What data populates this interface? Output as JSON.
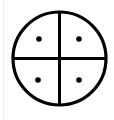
{
  "symbol": {
    "name": "quartered-circle-with-dots",
    "stroke_color": "#000000",
    "background_color": "#ffffff",
    "edge_line_color": "#ececec",
    "circle": {
      "cx": 59.5,
      "cy": 58.5,
      "r": 46.5,
      "stroke_width": 3.2
    },
    "dots": [
      {
        "cx": 39,
        "cy": 39,
        "r": 2.8
      },
      {
        "cx": 79,
        "cy": 39,
        "r": 2.8
      },
      {
        "cx": 38,
        "cy": 80,
        "r": 2.8
      },
      {
        "cx": 79,
        "cy": 80,
        "r": 2.8
      }
    ]
  }
}
